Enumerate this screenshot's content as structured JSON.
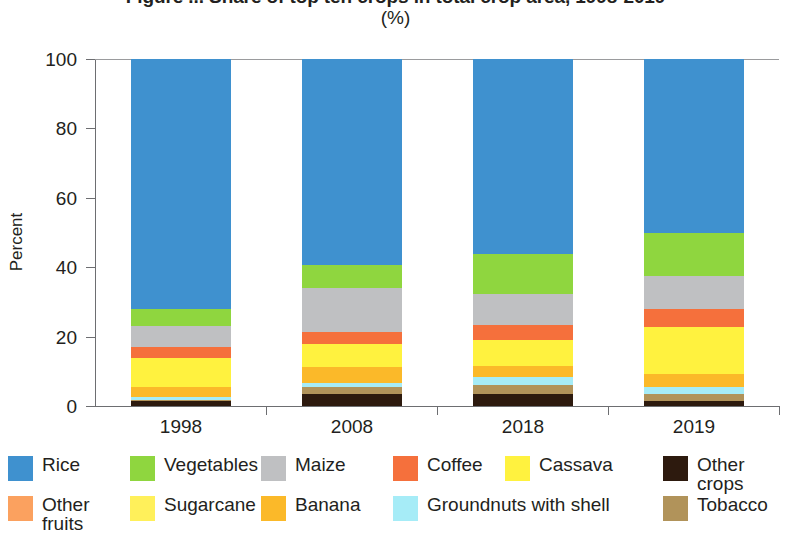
{
  "chart_data": {
    "type": "bar",
    "stacked": true,
    "stacked_mode": "percent",
    "title": "Figure ... Share of top ten crops in total crop area, 1998-2019",
    "subtitle": "(%)",
    "xlabel": "",
    "ylabel": "Percent",
    "ylim": [
      0,
      100
    ],
    "yticks": [
      0,
      20,
      40,
      60,
      80,
      100
    ],
    "ytick_labels": [
      "0",
      "20",
      "40",
      "60",
      "80",
      "100"
    ],
    "grid": false,
    "legend_position": "bottom",
    "categories": [
      "1998",
      "2008",
      "2018",
      "2019"
    ],
    "series": [
      {
        "name": "Rice",
        "color": "#3f91cf",
        "values": [
          72.0,
          59.5,
          56.2,
          50.0
        ]
      },
      {
        "name": "Vegetables",
        "color": "#8fd63f",
        "values": [
          5.0,
          6.5,
          11.5,
          12.5
        ]
      },
      {
        "name": "Maize",
        "color": "#bfc0c2",
        "values": [
          6.0,
          12.8,
          9.0,
          9.5
        ]
      },
      {
        "name": "Coffee",
        "color": "#f5703c",
        "values": [
          3.2,
          3.4,
          4.3,
          5.3
        ]
      },
      {
        "name": "Cassava",
        "color": "#fff23f",
        "values": [
          8.3,
          6.5,
          7.5,
          13.5
        ]
      },
      {
        "name": "Other fruits",
        "color": "#fba15f",
        "values": [
          0.0,
          0.0,
          0.0,
          0.0
        ]
      },
      {
        "name": "Sugarcane",
        "color": "#fff05a",
        "values": [
          0.0,
          0.0,
          0.0,
          0.0
        ]
      },
      {
        "name": "Banana",
        "color": "#fbb929",
        "values": [
          3.0,
          4.6,
          3.2,
          3.8
        ]
      },
      {
        "name": "Groundnuts with shell",
        "color": "#a6ecf7",
        "values": [
          0.8,
          1.2,
          2.2,
          2.0
        ]
      },
      {
        "name": "Tobacco",
        "color": "#b1935a",
        "values": [
          0.3,
          1.9,
          2.6,
          1.9
        ]
      },
      {
        "name": "Other crops",
        "color": "#2d1a0e",
        "values": [
          1.4,
          3.6,
          3.5,
          1.5
        ]
      }
    ]
  },
  "title": {
    "main": "Figure ... Share of top ten crops in total crop area, 1998-2019",
    "sub": "(%)"
  },
  "axes": {
    "y_title": "Percent",
    "y_labels": [
      "100",
      "80",
      "60",
      "40",
      "20",
      "0"
    ],
    "x_labels": [
      "1998",
      "2008",
      "2018",
      "2019"
    ]
  },
  "legend": {
    "items": [
      {
        "label": "Rice",
        "color": "#3f91cf"
      },
      {
        "label": "Vegetables",
        "color": "#8fd63f"
      },
      {
        "label": "Maize",
        "color": "#bfc0c2"
      },
      {
        "label": "Coffee",
        "color": "#f5703c"
      },
      {
        "label": "Cassava",
        "color": "#fff23f"
      },
      {
        "label": "Other crops",
        "color": "#2d1a0e"
      },
      {
        "label": "Other\nfruits",
        "color": "#fba15f"
      },
      {
        "label": "Sugarcane",
        "color": "#fff05a"
      },
      {
        "label": "Banana",
        "color": "#fbb929"
      },
      {
        "label": "Groundnuts with shell",
        "color": "#a6ecf7"
      },
      {
        "label": "Tobacco",
        "color": "#b1935a"
      }
    ]
  }
}
